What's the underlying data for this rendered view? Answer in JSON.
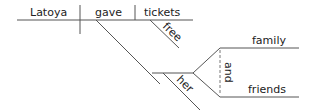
{
  "diagram": {
    "type": "sentence-diagram",
    "subject": "Latoya",
    "verb": "gave",
    "direct_object": "tickets",
    "direct_object_modifier": "free",
    "indirect_object": "her",
    "compound_object": {
      "items": [
        "family",
        "friends"
      ],
      "conjunction": "and"
    },
    "colors": {
      "line": "#555555",
      "text": "#222222",
      "background": "#ffffff"
    }
  }
}
